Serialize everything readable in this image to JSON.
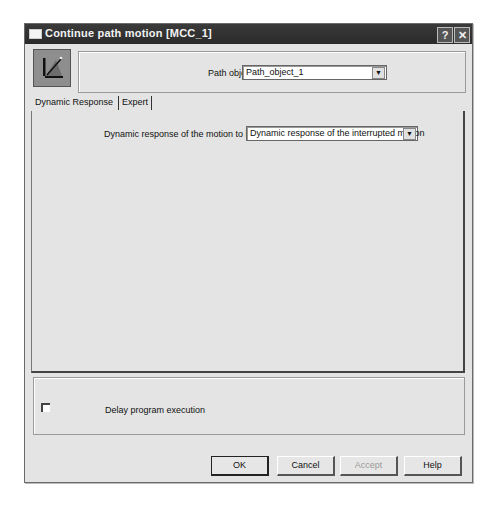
{
  "window": {
    "title": "Continue path motion [MCC_1]",
    "title_buttons": {
      "help": "?",
      "close": "✕"
    }
  },
  "header": {
    "icon": "path-motion-icon",
    "path_object_label": "Path object",
    "path_object_value": "Path_object_1"
  },
  "tabs": [
    {
      "label": "Dynamic Response",
      "active": true
    },
    {
      "label": "Expert",
      "active": false
    }
  ],
  "dynamic_response": {
    "label": "Dynamic response of the motion to be",
    "value": "Dynamic response of the interrupted motion"
  },
  "delay": {
    "checked": false,
    "label": "Delay program execution"
  },
  "buttons": {
    "ok": "OK",
    "cancel": "Cancel",
    "accept": "Accept",
    "help": "Help"
  },
  "dropdown_arrow": "▼"
}
